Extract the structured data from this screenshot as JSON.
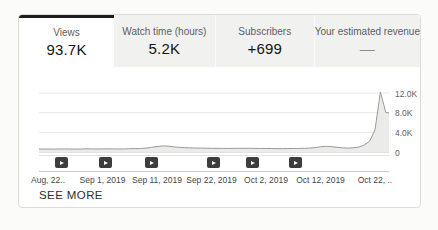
{
  "summary_tabs": [
    {
      "label": "Views",
      "value": "93.7K",
      "active": true
    },
    {
      "label": "Watch time (hours)",
      "value": "5.2K",
      "active": false
    },
    {
      "label": "Subscribers",
      "value": "+699",
      "active": false
    },
    {
      "label": "Your estimated revenue",
      "value": "—",
      "active": false
    }
  ],
  "see_more_label": "SEE MORE",
  "chart_data": {
    "type": "area",
    "title": "",
    "series": [
      {
        "name": "Views",
        "start_day": 0,
        "values": [
          620,
          580,
          600,
          640,
          610,
          590,
          620,
          650,
          630,
          600,
          640,
          660,
          630,
          610,
          640,
          680,
          700,
          720,
          800,
          950,
          1100,
          1250,
          1200,
          1050,
          950,
          880,
          850,
          820,
          800,
          780,
          760,
          750,
          740,
          730,
          740,
          750,
          760,
          750,
          740,
          730,
          720,
          710,
          700,
          700,
          710,
          720,
          740,
          760,
          800,
          900,
          1050,
          1150,
          1100,
          950,
          850,
          800,
          850,
          1000,
          1400,
          2200,
          4500,
          12200,
          8000
        ]
      }
    ],
    "x_tick_days": [
      0,
      10,
      20,
      30,
      40,
      50,
      60
    ],
    "x_tick_labels": [
      "Aug, 22..",
      "Sep 1, 2019",
      "Sep 11, 2019",
      "Sep 22, 2019",
      "Oct 2, 2019",
      "Oct 12, 2019",
      "Oct 22, .."
    ],
    "y_tick_values": [
      12000,
      8000,
      4000,
      0
    ],
    "y_tick_labels": [
      "12.0K",
      "8.0K",
      "4.0K",
      "0"
    ],
    "ylim": [
      0,
      12600
    ],
    "grid": true,
    "legend": "none",
    "video_marker_days": [
      2.4,
      10.5,
      18.9,
      30.3,
      37.6,
      45.5
    ],
    "colors": {
      "line": "#9a9a98",
      "fill": "#ebebe9",
      "grid": "#e8e8e6",
      "baseline": "#c6c6c4",
      "active_tab_accent": "#1d1d1d",
      "inactive_tab_bg": "#f1f1f0",
      "marker_bg": "#3d3d3d"
    }
  }
}
